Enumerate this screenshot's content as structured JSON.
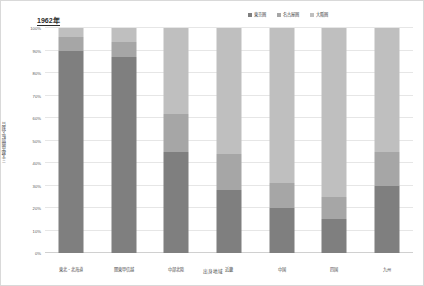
{
  "chart_data": {
    "type": "bar",
    "subtype": "stacked-100-percent",
    "title": "1962年",
    "xlabel": "出身地域",
    "ylabel": "三大都市圏別転入割合",
    "ylim": [
      0,
      100
    ],
    "y_unit": "%",
    "grid": true,
    "legend_position": "top-right",
    "categories": [
      "東北・北海道",
      "関東甲信越",
      "中部北陸",
      "近畿",
      "中国",
      "四国",
      "九州"
    ],
    "series": [
      {
        "name": "東京圏",
        "color": "#7f7f7f",
        "values": [
          90,
          87,
          45,
          28,
          20,
          15,
          30
        ]
      },
      {
        "name": "名古屋圏",
        "color": "#a6a6a6",
        "values": [
          6,
          7,
          17,
          16,
          11,
          10,
          15
        ]
      },
      {
        "name": "大阪圏",
        "color": "#bfbfbf",
        "values": [
          4,
          6,
          38,
          56,
          69,
          75,
          55
        ]
      }
    ],
    "y_ticks": [
      {
        "value": 100,
        "label": "100%"
      },
      {
        "value": 90,
        "label": "90%"
      },
      {
        "value": 80,
        "label": "80%"
      },
      {
        "value": 70,
        "label": "70%"
      },
      {
        "value": 60,
        "label": "60%"
      },
      {
        "value": 50,
        "label": "50%"
      },
      {
        "value": 40,
        "label": "40%"
      },
      {
        "value": 30,
        "label": "30%"
      },
      {
        "value": 20,
        "label": "20%"
      },
      {
        "value": 10,
        "label": "10%"
      },
      {
        "value": 0,
        "label": "0%"
      }
    ]
  }
}
